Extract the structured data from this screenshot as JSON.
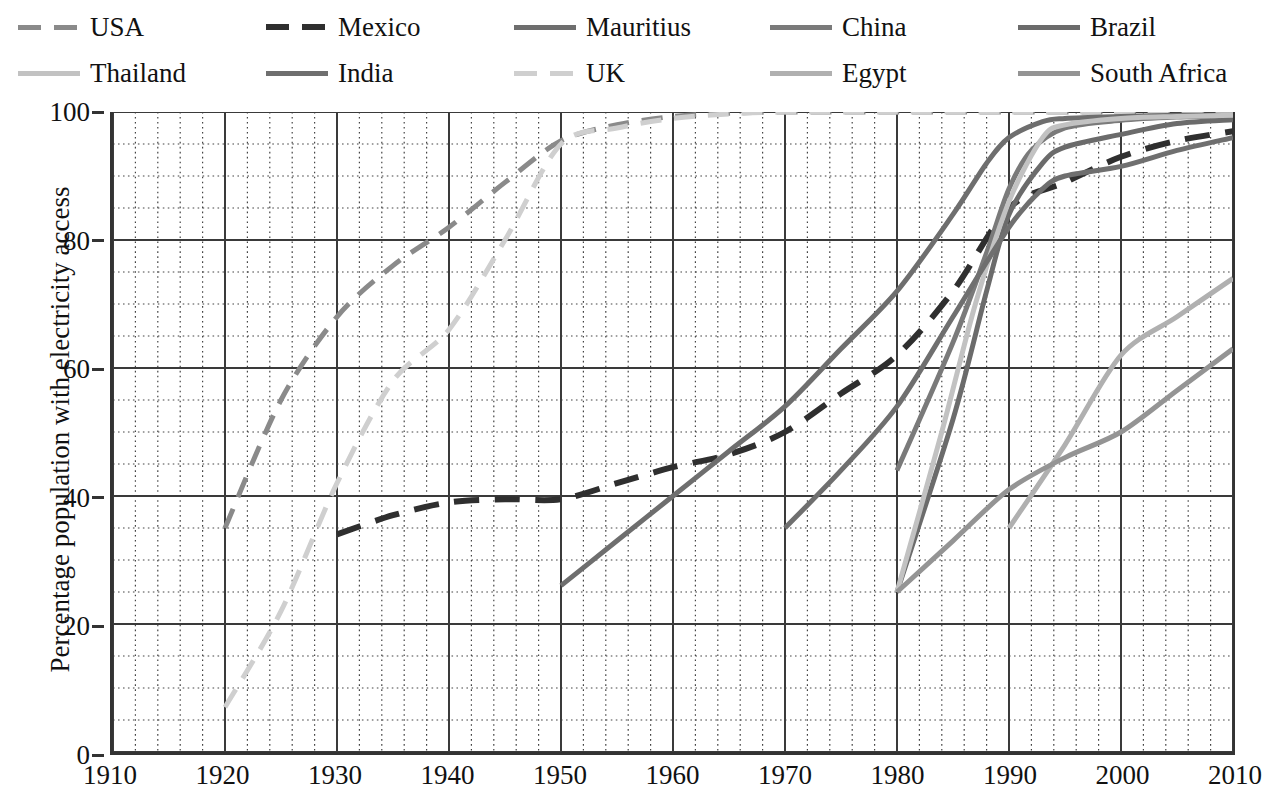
{
  "legend": {
    "rows": [
      [
        {
          "label": "USA",
          "color": "#8a8a8a",
          "dash": "dashed",
          "width": 5
        },
        {
          "label": "Mexico",
          "color": "#2f2f2f",
          "dash": "dashed",
          "width": 6
        },
        {
          "label": "Mauritius",
          "color": "#6e6e6e",
          "dash": "solid",
          "width": 5
        },
        {
          "label": "China",
          "color": "#7a7a7a",
          "dash": "solid",
          "width": 5
        },
        {
          "label": "Brazil",
          "color": "#6b6b6b",
          "dash": "solid",
          "width": 5
        }
      ],
      [
        {
          "label": "Thailand",
          "color": "#c2c2c2",
          "dash": "solid",
          "width": 5
        },
        {
          "label": "India",
          "color": "#6f6f6f",
          "dash": "solid",
          "width": 5
        },
        {
          "label": "UK",
          "color": "#cfcfcf",
          "dash": "dashed",
          "width": 5
        },
        {
          "label": "Egypt",
          "color": "#b0b0b0",
          "dash": "solid",
          "width": 5
        },
        {
          "label": "South Africa",
          "color": "#949494",
          "dash": "solid",
          "width": 5
        }
      ]
    ]
  },
  "chart_data": {
    "type": "line",
    "title": "",
    "xlabel": "",
    "ylabel": "Percentage population with electricity access",
    "xlim": [
      1910,
      2010
    ],
    "ylim": [
      0,
      100
    ],
    "xticks": [
      1910,
      1920,
      1930,
      1940,
      1950,
      1960,
      1970,
      1980,
      1990,
      2000,
      2010
    ],
    "yticks": [
      0,
      20,
      40,
      60,
      80,
      100
    ],
    "grid": "major solid + minor dotted",
    "minor_x_step": 2,
    "minor_y_step": 5,
    "legend_position": "top",
    "series": [
      {
        "name": "USA",
        "color": "#8a8a8a",
        "dash": "dashed",
        "width": 5,
        "x": [
          1920,
          1925,
          1930,
          1935,
          1940,
          1945,
          1950,
          1955,
          1960,
          1965,
          1970,
          1980,
          1990,
          2000,
          2010
        ],
        "y": [
          35,
          55,
          68,
          76,
          82,
          89,
          95.5,
          98,
          99.3,
          99.8,
          100,
          100,
          100,
          100,
          100
        ]
      },
      {
        "name": "UK",
        "color": "#cfcfcf",
        "dash": "dashed",
        "width": 5,
        "x": [
          1920,
          1925,
          1930,
          1935,
          1940,
          1945,
          1950,
          1955,
          1960,
          1965,
          1970,
          1980,
          1990,
          2000,
          2010
        ],
        "y": [
          7,
          22,
          42,
          58,
          66,
          80,
          95,
          97.5,
          99,
          99.7,
          100,
          100,
          100,
          100,
          100
        ]
      },
      {
        "name": "Mexico",
        "color": "#2f2f2f",
        "dash": "dashed",
        "width": 6,
        "x": [
          1930,
          1935,
          1940,
          1945,
          1950,
          1955,
          1960,
          1965,
          1970,
          1975,
          1980,
          1985,
          1990,
          1995,
          2000,
          2005,
          2010
        ],
        "y": [
          34,
          37,
          39,
          39.5,
          39.5,
          42,
          44.5,
          46.5,
          50,
          56,
          62,
          72,
          85,
          89,
          93,
          95.5,
          97
        ]
      },
      {
        "name": "Mauritius",
        "color": "#6e6e6e",
        "dash": "solid",
        "width": 5,
        "x": [
          1950,
          1955,
          1960,
          1965,
          1970,
          1975,
          1980,
          1985,
          1988,
          1990,
          1993,
          1995,
          2000,
          2005,
          2010
        ],
        "y": [
          26,
          33,
          40,
          47,
          54,
          63,
          72,
          84,
          92,
          96,
          98.5,
          99,
          99.3,
          99.5,
          99.5
        ]
      },
      {
        "name": "China",
        "color": "#7a7a7a",
        "dash": "solid",
        "width": 5,
        "x": [
          1980,
          1985,
          1988,
          1990,
          1992,
          1995,
          2000,
          2005,
          2010
        ],
        "y": [
          44,
          64,
          78,
          88,
          94,
          97.5,
          98.7,
          99.2,
          99.4
        ]
      },
      {
        "name": "Brazil",
        "color": "#6b6b6b",
        "dash": "solid",
        "width": 5,
        "x": [
          1980,
          1985,
          1988,
          1990,
          1993,
          1995,
          2000,
          2005,
          2010
        ],
        "y": [
          25,
          52,
          72,
          84,
          92,
          94.5,
          96.5,
          98.2,
          98.8
        ]
      },
      {
        "name": "Thailand",
        "color": "#c2c2c2",
        "dash": "solid",
        "width": 5,
        "x": [
          1980,
          1984,
          1987,
          1990,
          1993,
          1995,
          2000,
          2005,
          2010
        ],
        "y": [
          25,
          50,
          70,
          86,
          96,
          98,
          99,
          99.3,
          99.5
        ]
      },
      {
        "name": "India",
        "color": "#6f6f6f",
        "dash": "solid",
        "width": 5,
        "x": [
          1970,
          1975,
          1980,
          1985,
          1990,
          1993,
          1995,
          2000,
          2005,
          2010
        ],
        "y": [
          35,
          44,
          54,
          68,
          82,
          88,
          90,
          91.5,
          94,
          96
        ]
      },
      {
        "name": "Egypt",
        "color": "#b0b0b0",
        "dash": "solid",
        "width": 5,
        "x": [
          1990,
          1995,
          2000,
          2005,
          2010
        ],
        "y": [
          35,
          48,
          62,
          68,
          74
        ]
      },
      {
        "name": "South Africa",
        "color": "#949494",
        "dash": "solid",
        "width": 5,
        "x": [
          1980,
          1985,
          1990,
          1995,
          2000,
          2005,
          2010
        ],
        "y": [
          25,
          33,
          41,
          46,
          50,
          56.5,
          63
        ]
      }
    ]
  }
}
